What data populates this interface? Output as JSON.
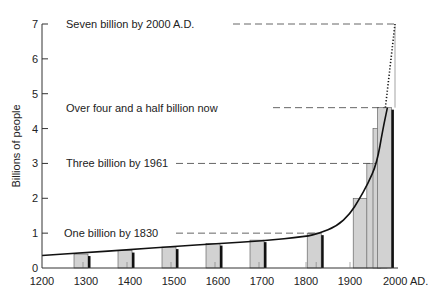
{
  "chart_data": {
    "type": "bar",
    "title": "",
    "xlabel": "",
    "ylabel": "Billions of people",
    "xlim": [
      1200,
      2000
    ],
    "ylim": [
      0,
      7
    ],
    "x_ticks": [
      1200,
      1300,
      1400,
      1500,
      1600,
      1700,
      1800,
      1900,
      2000
    ],
    "x_tick_labels": [
      "1200",
      "1300",
      "1400",
      "1500",
      "1600",
      "1700",
      "1800",
      "1900",
      "2000 AD."
    ],
    "y_ticks": [
      0,
      1,
      2,
      3,
      4,
      5,
      6,
      7
    ],
    "y_tick_labels": [
      "0",
      "1",
      "2",
      "3",
      "4",
      "5",
      "6",
      "7"
    ],
    "grid": false,
    "legend": null,
    "bars": [
      {
        "year": 1300,
        "value": 0.4
      },
      {
        "year": 1400,
        "value": 0.5
      },
      {
        "year": 1500,
        "value": 0.6
      },
      {
        "year": 1600,
        "value": 0.7
      },
      {
        "year": 1700,
        "value": 0.8
      },
      {
        "year": 1830,
        "value": 1.0
      },
      {
        "year": 1930,
        "value": 2.0
      },
      {
        "year": 1961,
        "value": 3.0
      },
      {
        "year": 1975,
        "value": 4.0
      },
      {
        "year": 1985,
        "value": 4.6
      }
    ],
    "curve": {
      "name": "Population growth",
      "x": [
        1200,
        1300,
        1400,
        1500,
        1600,
        1700,
        1800,
        1830,
        1870,
        1900,
        1920,
        1940,
        1961,
        1975,
        1985
      ],
      "y": [
        0.36,
        0.44,
        0.53,
        0.62,
        0.7,
        0.78,
        0.9,
        1.0,
        1.2,
        1.55,
        1.95,
        2.4,
        3.0,
        4.0,
        4.6
      ]
    },
    "projection": {
      "style": "dotted",
      "x": [
        1985,
        2000
      ],
      "y": [
        4.6,
        7.0
      ]
    },
    "annotations": [
      {
        "text": "Seven billion by 2000 A.D.",
        "value": 7.0,
        "year": 2000
      },
      {
        "text": "Over four and a half billion now",
        "value": 4.6,
        "year": 1985
      },
      {
        "text": "Three billion by 1961",
        "value": 3.0,
        "year": 1961
      },
      {
        "text": "One billion by 1830",
        "value": 1.0,
        "year": 1830
      }
    ]
  },
  "colors": {
    "bar_fill": "#d2d2d2",
    "bar_shadow": "#111111",
    "line": "#111111",
    "dash": "#555555",
    "text": "#222222"
  }
}
